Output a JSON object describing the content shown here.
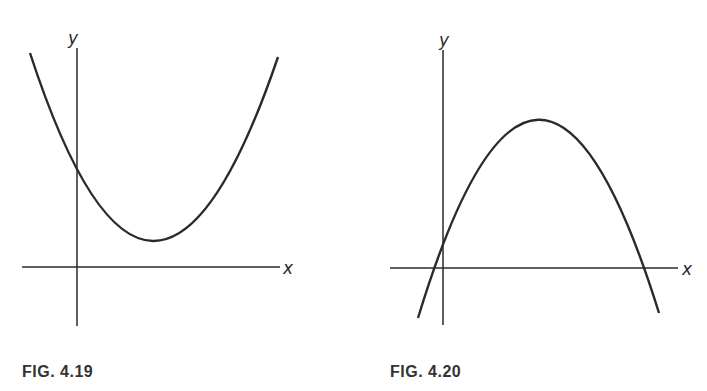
{
  "figures": [
    {
      "caption": "FIG. 4.19",
      "x_label": "x",
      "y_label": "y",
      "description": "Upward-opening parabola, vertex above x-axis in first quadrant, positive y-intercept, no real x-intercepts"
    },
    {
      "caption": "FIG. 4.20",
      "x_label": "x",
      "y_label": "y",
      "description": "Downward-opening parabola, vertex in first quadrant, positive y-intercept, one negative and one positive x-intercept"
    }
  ],
  "colors": {
    "ink": "#222222",
    "background": "#ffffff"
  }
}
